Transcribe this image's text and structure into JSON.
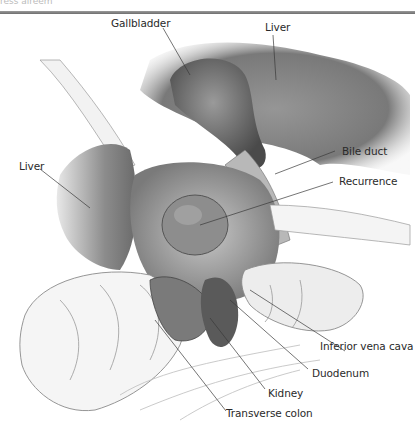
{
  "header": {
    "cut_off_caption": "ress aireem"
  },
  "figure": {
    "type": "anatomical illustration",
    "labels": [
      {
        "id": "gallbladder",
        "text": "Gallbladder"
      },
      {
        "id": "liver-top",
        "text": "Liver"
      },
      {
        "id": "liver-left",
        "text": "Liver"
      },
      {
        "id": "bile-duct",
        "text": "Bile duct"
      },
      {
        "id": "recurrence",
        "text": "Recurrence"
      },
      {
        "id": "inferior-vena-cava",
        "text": "Inferior vena cava"
      },
      {
        "id": "duodenum",
        "text": "Duodenum"
      },
      {
        "id": "kidney",
        "text": "Kidney"
      },
      {
        "id": "transverse-colon",
        "text": "Transverse colon"
      }
    ]
  }
}
